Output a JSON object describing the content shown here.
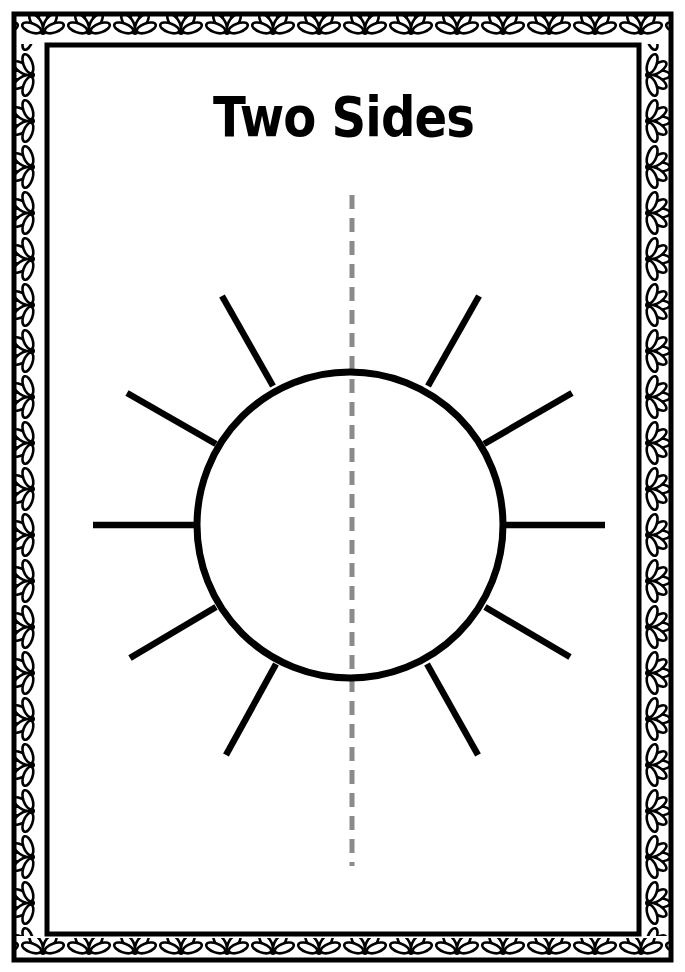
{
  "worksheet": {
    "title": "Two Sides"
  },
  "colors": {
    "ink": "#000000",
    "divider": "#8a8a8a",
    "paper": "#ffffff"
  },
  "figure": {
    "type": "sun-outline",
    "ray_count": 10,
    "divider": "dashed-vertical-line"
  },
  "icons": {
    "border": "flower-border",
    "sun": "sun-outline-icon"
  }
}
